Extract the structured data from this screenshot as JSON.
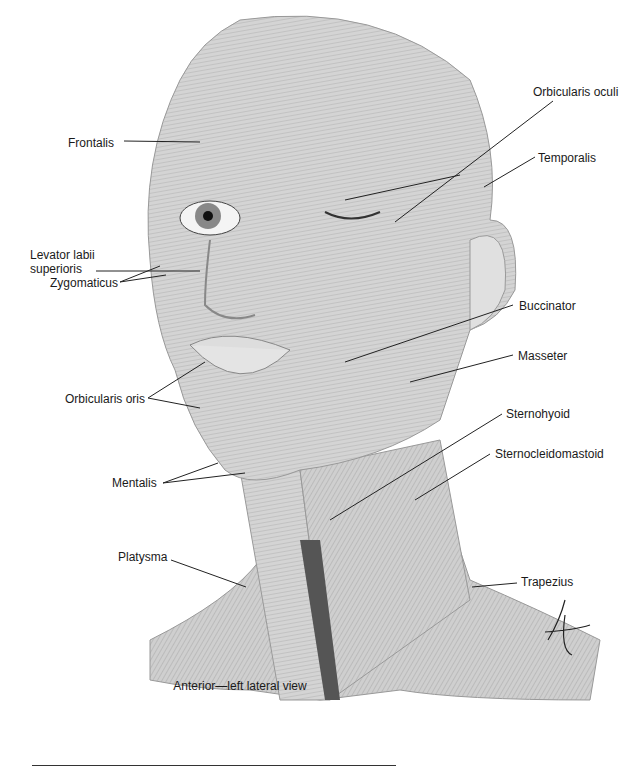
{
  "figure": {
    "caption": "Anterior—left lateral view",
    "signature": "tina",
    "labels": [
      {
        "id": "frontalis",
        "text": "Frontalis",
        "x": 68,
        "y": 136
      },
      {
        "id": "levator",
        "text": "Levator labii",
        "x": 30,
        "y": 248
      },
      {
        "id": "levator2",
        "text": "superioris",
        "x": 30,
        "y": 262
      },
      {
        "id": "zygomaticus",
        "text": "Zygomaticus",
        "x": 50,
        "y": 276
      },
      {
        "id": "orbicularis-oris",
        "text": "Orbicularis oris",
        "x": 65,
        "y": 392
      },
      {
        "id": "mentalis",
        "text": "Mentalis",
        "x": 112,
        "y": 476
      },
      {
        "id": "platysma",
        "text": "Platysma",
        "x": 118,
        "y": 550
      },
      {
        "id": "orbicularis-oculi",
        "text": "Orbicularis oculi",
        "x": 533,
        "y": 85
      },
      {
        "id": "temporalis",
        "text": "Temporalis",
        "x": 538,
        "y": 151
      },
      {
        "id": "buccinator",
        "text": "Buccinator",
        "x": 519,
        "y": 299
      },
      {
        "id": "masseter",
        "text": "Masseter",
        "x": 518,
        "y": 349
      },
      {
        "id": "sternohyoid",
        "text": "Sternohyoid",
        "x": 506,
        "y": 407
      },
      {
        "id": "sternocleidomastoid",
        "text": "Sternocleidomastoid",
        "x": 495,
        "y": 447
      },
      {
        "id": "trapezius",
        "text": "Trapezius",
        "x": 521,
        "y": 575
      }
    ]
  },
  "colors": {
    "muscle": "#c8c8c8",
    "muscle_dark": "#8f8f8f",
    "line": "#222222",
    "text": "#1a1a1a"
  }
}
